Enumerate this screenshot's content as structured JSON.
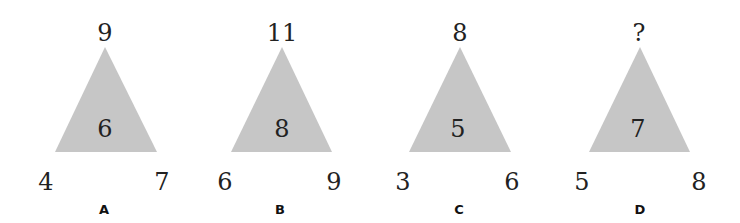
{
  "puzzle": {
    "fill_color": "#c6c6c6",
    "triangles": [
      {
        "label": "A",
        "top": "9",
        "center": "6",
        "bottom_left": "4",
        "bottom_right": "7"
      },
      {
        "label": "B",
        "top": "11",
        "center": "8",
        "bottom_left": "6",
        "bottom_right": "9"
      },
      {
        "label": "C",
        "top": "8",
        "center": "5",
        "bottom_left": "3",
        "bottom_right": "6"
      },
      {
        "label": "D",
        "top": "?",
        "center": "7",
        "bottom_left": "5",
        "bottom_right": "8"
      }
    ]
  }
}
